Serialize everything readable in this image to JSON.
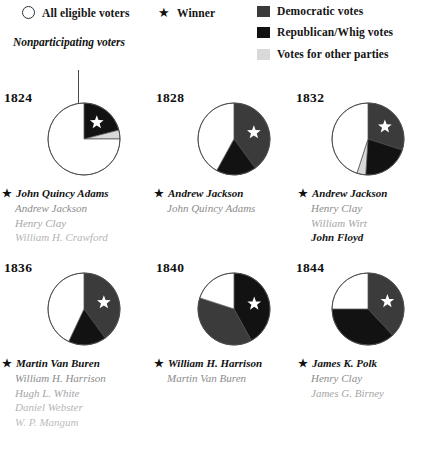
{
  "legend": {
    "items": [
      {
        "id": "all-eligible-voters",
        "label": "All eligible voters",
        "swatch": "circle-outline",
        "color": "#ffffff"
      },
      {
        "id": "winner",
        "label": "Winner",
        "swatch": "star-icon",
        "color": "#111111"
      },
      {
        "id": "democratic-votes",
        "label": "Democratic votes",
        "swatch": "box",
        "color": "#3b3b3b"
      },
      {
        "id": "republican-whig-votes",
        "label": "Republican/Whig votes",
        "swatch": "box",
        "color": "#121212"
      },
      {
        "id": "votes-for-other-parties",
        "label": "Votes for other parties",
        "swatch": "box",
        "color": "#d9d9d9"
      }
    ]
  },
  "annotation": {
    "nonparticipating_label": "Nonparticipating\nvoters"
  },
  "colors": {
    "nonparticipating": "#ffffff",
    "democratic": "#3b3b3b",
    "republican_whig": "#121212",
    "other_parties": "#d9d9d9",
    "outline": "#4a4a4a",
    "star": "#ffffff"
  },
  "chart_data": {
    "type": "pie",
    "legend_position": "top",
    "charts": [
      {
        "year": "1824",
        "winner": "John Quincy Adams",
        "slices": [
          {
            "name": "Republican/Whig votes",
            "category": "republican_whig",
            "value": 21,
            "color": "#121212"
          },
          {
            "name": "Votes for other parties",
            "category": "other_parties",
            "value": 4,
            "color": "#d9d9d9"
          },
          {
            "name": "Nonparticipating voters",
            "category": "nonparticipating",
            "value": 75,
            "color": "#ffffff"
          }
        ],
        "star_slice_index": 0,
        "candidates": [
          {
            "name": "John Quincy Adams",
            "rank": 0,
            "winner": true
          },
          {
            "name": "Andrew Jackson",
            "rank": 1,
            "winner": false
          },
          {
            "name": "Henry Clay",
            "rank": 2,
            "winner": false
          },
          {
            "name": "William H. Crawford",
            "rank": 3,
            "winner": false
          }
        ]
      },
      {
        "year": "1828",
        "winner": "Andrew Jackson",
        "slices": [
          {
            "name": "Democratic votes",
            "category": "democratic",
            "value": 40,
            "color": "#3b3b3b"
          },
          {
            "name": "Republican/Whig votes",
            "category": "republican_whig",
            "value": 18,
            "color": "#121212"
          },
          {
            "name": "Nonparticipating voters",
            "category": "nonparticipating",
            "value": 42,
            "color": "#ffffff"
          }
        ],
        "star_slice_index": 0,
        "candidates": [
          {
            "name": "Andrew Jackson",
            "rank": 0,
            "winner": true
          },
          {
            "name": "John Quincy Adams",
            "rank": 1,
            "winner": false
          }
        ]
      },
      {
        "year": "1832",
        "winner": "Andrew Jackson",
        "slices": [
          {
            "name": "Democratic votes",
            "category": "democratic",
            "value": 30,
            "color": "#3b3b3b"
          },
          {
            "name": "Republican/Whig votes",
            "category": "republican_whig",
            "value": 21,
            "color": "#121212"
          },
          {
            "name": "Votes for other parties",
            "category": "other_parties",
            "value": 4,
            "color": "#d9d9d9"
          },
          {
            "name": "Nonparticipating voters",
            "category": "nonparticipating",
            "value": 45,
            "color": "#ffffff"
          }
        ],
        "star_slice_index": 0,
        "candidates": [
          {
            "name": "Andrew Jackson",
            "rank": 0,
            "winner": true
          },
          {
            "name": "Henry Clay",
            "rank": 1,
            "winner": false
          },
          {
            "name": "William Wirt",
            "rank": 2,
            "winner": false
          },
          {
            "name": "John Floyd",
            "rank": 5,
            "winner": false
          }
        ]
      },
      {
        "year": "1836",
        "winner": "Martin Van Buren",
        "slices": [
          {
            "name": "Democratic votes",
            "category": "democratic",
            "value": 40,
            "color": "#3b3b3b"
          },
          {
            "name": "Republican/Whig votes",
            "category": "republican_whig",
            "value": 17,
            "color": "#121212"
          },
          {
            "name": "Nonparticipating voters",
            "category": "nonparticipating",
            "value": 43,
            "color": "#ffffff"
          }
        ],
        "star_slice_index": 0,
        "candidates": [
          {
            "name": "Martin Van Buren",
            "rank": 0,
            "winner": true
          },
          {
            "name": "William H. Harrison",
            "rank": 1,
            "winner": false
          },
          {
            "name": "Hugh L. White",
            "rank": 2,
            "winner": false
          },
          {
            "name": "Daniel Webster",
            "rank": 3,
            "winner": false
          },
          {
            "name": "W. P. Mangum",
            "rank": 4,
            "winner": false
          }
        ]
      },
      {
        "year": "1840",
        "winner": "William H. Harrison",
        "slices": [
          {
            "name": "Republican/Whig votes",
            "category": "republican_whig",
            "value": 42,
            "color": "#121212"
          },
          {
            "name": "Democratic votes",
            "category": "democratic",
            "value": 38,
            "color": "#3b3b3b"
          },
          {
            "name": "Nonparticipating voters",
            "category": "nonparticipating",
            "value": 20,
            "color": "#ffffff"
          }
        ],
        "star_slice_index": 0,
        "candidates": [
          {
            "name": "William H. Harrison",
            "rank": 0,
            "winner": true
          },
          {
            "name": "Martin Van Buren",
            "rank": 1,
            "winner": false
          }
        ]
      },
      {
        "year": "1844",
        "winner": "James K. Polk",
        "slices": [
          {
            "name": "Democratic votes",
            "category": "democratic",
            "value": 38,
            "color": "#3b3b3b"
          },
          {
            "name": "Republican/Whig votes",
            "category": "republican_whig",
            "value": 37,
            "color": "#121212"
          },
          {
            "name": "Nonparticipating voters",
            "category": "nonparticipating",
            "value": 25,
            "color": "#ffffff"
          }
        ],
        "star_slice_index": 0,
        "candidates": [
          {
            "name": "James K. Polk",
            "rank": 0,
            "winner": true
          },
          {
            "name": "Henry Clay",
            "rank": 1,
            "winner": false
          },
          {
            "name": "James G. Birney",
            "rank": 2,
            "winner": false
          }
        ]
      }
    ]
  }
}
